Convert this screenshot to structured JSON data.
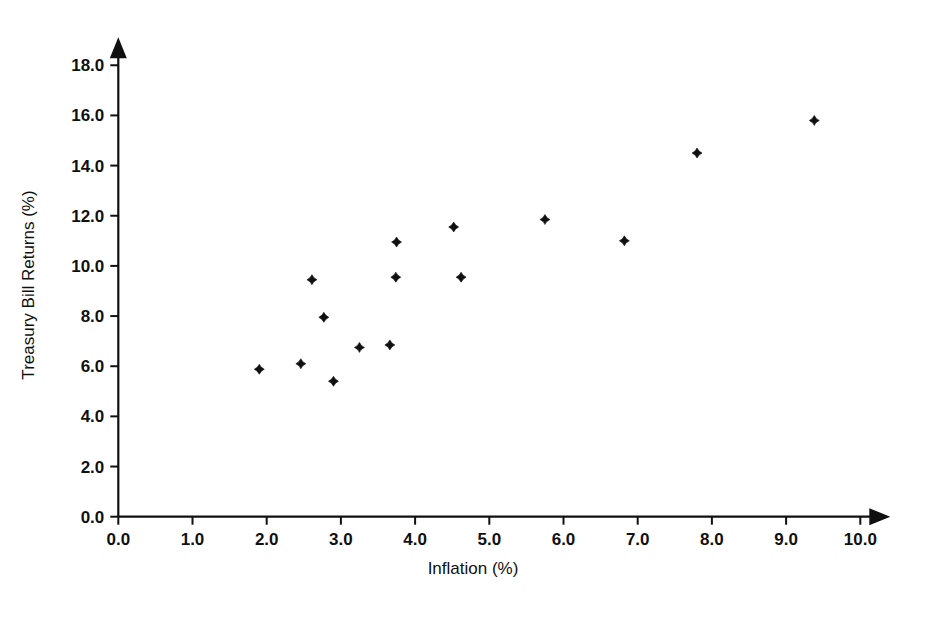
{
  "chart_data": {
    "type": "scatter",
    "title": "",
    "subtitle": "",
    "xlabel": "Inflation (%)",
    "ylabel": "Treasury Bill Returns (%)",
    "xlim": [
      0.0,
      10.0
    ],
    "ylim": [
      0.0,
      18.0
    ],
    "xticks": [
      0.0,
      1.0,
      2.0,
      3.0,
      4.0,
      5.0,
      6.0,
      7.0,
      8.0,
      9.0,
      10.0
    ],
    "yticks": [
      0.0,
      2.0,
      4.0,
      6.0,
      8.0,
      10.0,
      12.0,
      14.0,
      16.0,
      18.0
    ],
    "xtick_labels": [
      "0.0",
      "1.0",
      "2.0",
      "3.0",
      "4.0",
      "5.0",
      "6.0",
      "7.0",
      "8.0",
      "9.0",
      "10.0"
    ],
    "ytick_labels": [
      "0.0",
      "2.0",
      "4.0",
      "6.0",
      "8.0",
      "10.0",
      "12.0",
      "14.0",
      "16.0",
      "18.0"
    ],
    "grid": false,
    "legend": false,
    "legend_position": "none",
    "marker": "diamond",
    "marker_color": "#101010",
    "axes_style": "arrow-tipped-open-axes",
    "x": [
      1.9,
      2.46,
      2.61,
      2.77,
      2.9,
      3.25,
      3.66,
      3.74,
      3.75,
      4.52,
      4.62,
      5.75,
      6.82,
      7.8,
      9.38
    ],
    "y": [
      5.88,
      6.1,
      9.45,
      7.95,
      5.4,
      6.75,
      6.85,
      9.55,
      10.95,
      11.55,
      9.55,
      11.85,
      11.0,
      14.5,
      15.8
    ],
    "points": [
      {
        "x": 1.9,
        "y": 5.88
      },
      {
        "x": 2.46,
        "y": 6.1
      },
      {
        "x": 2.61,
        "y": 9.45
      },
      {
        "x": 2.77,
        "y": 7.95
      },
      {
        "x": 2.9,
        "y": 5.4
      },
      {
        "x": 3.25,
        "y": 6.75
      },
      {
        "x": 3.66,
        "y": 6.85
      },
      {
        "x": 3.74,
        "y": 9.55
      },
      {
        "x": 3.75,
        "y": 10.95
      },
      {
        "x": 4.52,
        "y": 11.55
      },
      {
        "x": 4.62,
        "y": 9.55
      },
      {
        "x": 5.75,
        "y": 11.85
      },
      {
        "x": 6.82,
        "y": 11.0
      },
      {
        "x": 7.8,
        "y": 14.5
      },
      {
        "x": 9.38,
        "y": 15.8
      }
    ],
    "n_points": 15,
    "colors": {
      "marker": "#101010",
      "axis": "#101010",
      "text": "#101010",
      "background": "#ffffff"
    }
  }
}
